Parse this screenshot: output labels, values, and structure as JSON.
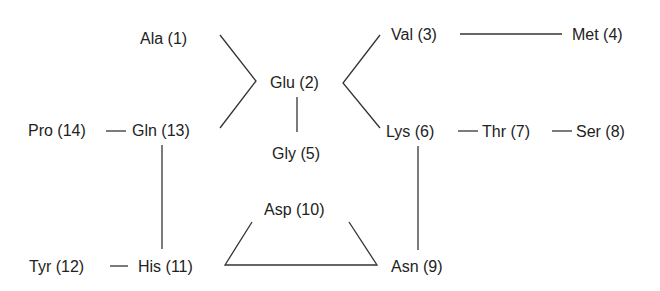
{
  "diagram": {
    "type": "sequence-connectivity",
    "nodes": [
      {
        "id": "ala1",
        "label": "Ala (1)",
        "x": 140,
        "y": 30
      },
      {
        "id": "glu2",
        "label": "Glu (2)",
        "x": 270,
        "y": 74
      },
      {
        "id": "val3",
        "label": "Val (3)",
        "x": 391,
        "y": 26
      },
      {
        "id": "met4",
        "label": "Met (4)",
        "x": 572,
        "y": 26
      },
      {
        "id": "gly5",
        "label": "Gly (5)",
        "x": 272,
        "y": 145
      },
      {
        "id": "lys6",
        "label": "Lys (6)",
        "x": 386,
        "y": 123
      },
      {
        "id": "thr7",
        "label": "Thr (7)",
        "x": 482,
        "y": 123
      },
      {
        "id": "ser8",
        "label": "Ser (8)",
        "x": 576,
        "y": 123
      },
      {
        "id": "asn9",
        "label": "Asn (9)",
        "x": 391,
        "y": 260
      },
      {
        "id": "asp10",
        "label": "Asp (10)",
        "x": 264,
        "y": 201
      },
      {
        "id": "his11",
        "label": "His (11)",
        "x": 138,
        "y": 260
      },
      {
        "id": "tyr12",
        "label": "Tyr (12)",
        "x": 29,
        "y": 260
      },
      {
        "id": "gln13",
        "label": "Gln (13)",
        "x": 132,
        "y": 122
      },
      {
        "id": "pro14",
        "label": "Pro (14)",
        "x": 28,
        "y": 122
      }
    ],
    "edges": [
      {
        "from": "ala1",
        "to": "glu2"
      },
      {
        "from": "gln13",
        "to": "glu2"
      },
      {
        "from": "glu2",
        "to": "val3"
      },
      {
        "from": "glu2",
        "to": "lys6"
      },
      {
        "from": "glu2",
        "to": "gly5"
      },
      {
        "from": "val3",
        "to": "met4"
      },
      {
        "from": "lys6",
        "to": "thr7"
      },
      {
        "from": "thr7",
        "to": "ser8"
      },
      {
        "from": "lys6",
        "to": "asn9"
      },
      {
        "from": "pro14",
        "to": "gln13"
      },
      {
        "from": "gln13",
        "to": "his11"
      },
      {
        "from": "tyr12",
        "to": "his11"
      },
      {
        "from": "his11",
        "to": "asp10"
      },
      {
        "from": "his11",
        "to": "asn9"
      },
      {
        "from": "asp10",
        "to": "asn9"
      }
    ],
    "line_color": "#333333",
    "text_color": "#222222"
  }
}
